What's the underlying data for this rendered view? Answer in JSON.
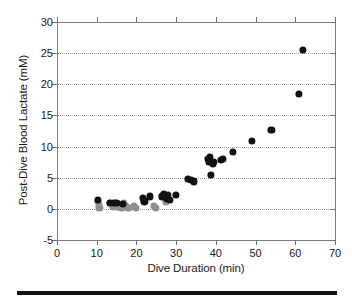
{
  "chart_data": {
    "type": "scatter",
    "title": "",
    "xlabel": "Dive Duration (min)",
    "ylabel": "Post-Dive Blood Lactate (mM)",
    "xlim": [
      0,
      70
    ],
    "ylim": [
      -5,
      30
    ],
    "xticks": [
      0,
      10,
      20,
      30,
      40,
      50,
      60,
      70
    ],
    "yticks": [
      -5,
      0,
      5,
      10,
      15,
      20,
      25,
      30
    ],
    "xtick_labels": [
      "0",
      "10",
      "20",
      "30",
      "40",
      "50",
      "60",
      "70"
    ],
    "ytick_labels": [
      "-5",
      "0",
      "5",
      "10",
      "15",
      "20",
      "25",
      "30"
    ],
    "grid": "horizontal-dotted",
    "legend": "none",
    "marker_colors": {
      "filled_black": "#111111",
      "filled_gray": "#8f8f8f"
    },
    "series": [
      {
        "name": "gray-markers",
        "color": "#8f8f8f",
        "marker": "filled-circle",
        "points": [
          [
            10.4,
            1.3
          ],
          [
            10.5,
            0.6
          ],
          [
            10.7,
            0.2
          ],
          [
            13.3,
            0.9
          ],
          [
            14.0,
            0.4
          ],
          [
            14.6,
            1.0
          ],
          [
            15.2,
            0.3
          ],
          [
            15.6,
            0.7
          ],
          [
            16.2,
            0.2
          ],
          [
            16.9,
            0.9
          ],
          [
            17.4,
            0.4
          ],
          [
            18.0,
            0.2
          ],
          [
            19.3,
            0.5
          ],
          [
            19.8,
            0.2
          ],
          [
            24.4,
            0.5
          ],
          [
            24.9,
            0.2
          ],
          [
            27.4,
            1.2
          ]
        ]
      },
      {
        "name": "black-markers",
        "color": "#111111",
        "marker": "filled-circle",
        "points": [
          [
            10.3,
            1.4
          ],
          [
            13.4,
            1.0
          ],
          [
            14.3,
            0.9
          ],
          [
            15.0,
            0.9
          ],
          [
            16.5,
            0.8
          ],
          [
            21.6,
            1.8
          ],
          [
            22.0,
            1.2
          ],
          [
            23.4,
            2.0
          ],
          [
            26.5,
            2.0
          ],
          [
            27.0,
            2.4
          ],
          [
            27.6,
            1.6
          ],
          [
            28.0,
            2.2
          ],
          [
            28.4,
            1.4
          ],
          [
            29.9,
            2.3
          ],
          [
            32.9,
            4.8
          ],
          [
            33.8,
            4.6
          ],
          [
            34.4,
            4.4
          ],
          [
            37.9,
            8.0
          ],
          [
            38.3,
            7.6
          ],
          [
            38.5,
            8.3
          ],
          [
            38.8,
            5.4
          ],
          [
            39.2,
            7.3
          ],
          [
            39.6,
            7.6
          ],
          [
            41.3,
            7.9
          ],
          [
            41.8,
            8.0
          ],
          [
            44.2,
            9.2
          ],
          [
            49.0,
            10.9
          ],
          [
            54.0,
            12.7
          ],
          [
            61.0,
            18.5
          ],
          [
            61.9,
            25.5
          ]
        ]
      }
    ]
  },
  "axes": {
    "x_title": "Dive Duration (min)",
    "y_title": "Post-Dive Blood Lactate (mM)"
  }
}
